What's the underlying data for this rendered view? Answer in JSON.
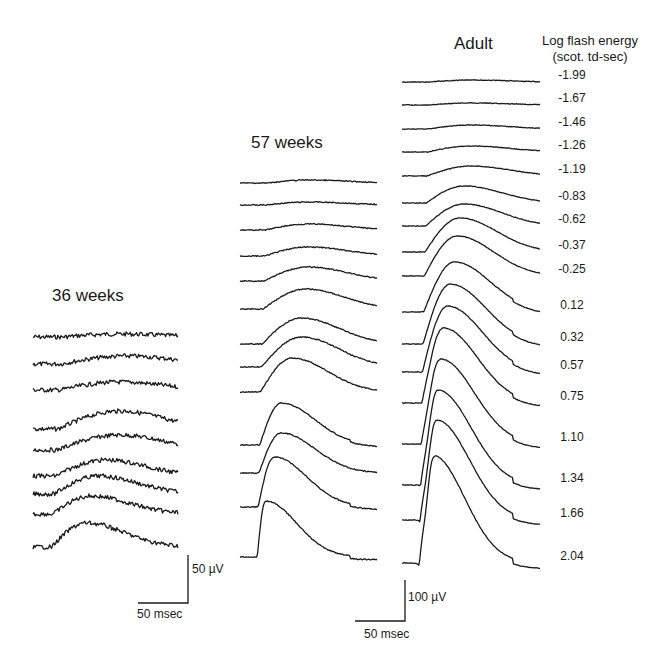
{
  "chart_data": {
    "type": "line",
    "title": "",
    "legend_title": "Log flash energy",
    "legend_subtitle": "(scot. td-sec)",
    "energies": [
      "-1.99",
      "-1.67",
      "-1.46",
      "-1.26",
      "-1.19",
      "-0.83",
      "-0.62",
      "-0.37",
      "-0.25",
      "0.12",
      "0.32",
      "0.57",
      "0.75",
      "1.10",
      "1.34",
      "1.66",
      "2.04"
    ],
    "panels": [
      {
        "name": "36 weeks",
        "trace_count": 9,
        "baselines_y": [
          337,
          364,
          390,
          429,
          450,
          476,
          494,
          514,
          547
        ],
        "x_start": 33,
        "x_end": 178,
        "amplitudes": [
          3,
          8,
          8,
          18,
          15,
          16,
          18,
          18,
          24
        ],
        "peak_frac": [
          0.6,
          0.65,
          0.6,
          0.6,
          0.6,
          0.5,
          0.45,
          0.4,
          0.37
        ],
        "noise": 2.2,
        "scale_bar": {
          "voltage": "50 µV",
          "time": "50 msec"
        }
      },
      {
        "name": "57 weeks",
        "trace_count": 13,
        "baselines_y": [
          183,
          205,
          230,
          256,
          281,
          309,
          344,
          367,
          392,
          445,
          473,
          507,
          557
        ],
        "x_start": 240,
        "x_end": 377,
        "amplitudes": [
          3,
          3,
          6,
          9,
          14,
          20,
          26,
          30,
          34,
          42,
          40,
          50,
          56
        ],
        "peak_frac": [
          0.5,
          0.5,
          0.5,
          0.5,
          0.5,
          0.48,
          0.45,
          0.45,
          0.38,
          0.3,
          0.3,
          0.25,
          0.18
        ],
        "noise": 0.5
      },
      {
        "name": "Adult",
        "trace_count": 17,
        "baselines_y": [
          82,
          105,
          129,
          152,
          176,
          203,
          226,
          252,
          276,
          312,
          344,
          372,
          403,
          444,
          485,
          520,
          563
        ],
        "x_start": 402,
        "x_end": 540,
        "amplitudes": [
          2,
          2,
          4,
          6,
          10,
          17,
          22,
          34,
          40,
          50,
          60,
          66,
          75,
          85,
          95,
          100,
          108
        ],
        "peak_frac": [
          0.5,
          0.5,
          0.5,
          0.5,
          0.5,
          0.45,
          0.45,
          0.42,
          0.4,
          0.38,
          0.35,
          0.33,
          0.3,
          0.28,
          0.26,
          0.25,
          0.22
        ],
        "a_wave": [
          0,
          0,
          0,
          0,
          0,
          0,
          0,
          0,
          0,
          0,
          0,
          0,
          3,
          6,
          10,
          14,
          24
        ],
        "noise": 0.3,
        "scale_bar": {
          "voltage": "100 µV",
          "time": "50 msec"
        }
      }
    ]
  },
  "labels": {
    "panel_36": "36 weeks",
    "panel_57": "57 weeks",
    "panel_adult": "Adult",
    "legend_line1": "Log flash energy",
    "legend_line2": "(scot. td-sec)",
    "scale_36_voltage": "50 µV",
    "scale_36_time": "50 msec",
    "scale_adult_voltage": "100 µV",
    "scale_adult_time": "50 msec"
  }
}
